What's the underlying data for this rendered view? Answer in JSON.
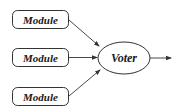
{
  "diagram": {
    "modules": [
      {
        "label": "Module"
      },
      {
        "label": "Module"
      },
      {
        "label": "Module"
      }
    ],
    "voter": {
      "label": "Voter"
    },
    "colors": {
      "stroke": "#333333",
      "text": "#1a1a1a",
      "background": "#ffffff"
    }
  }
}
